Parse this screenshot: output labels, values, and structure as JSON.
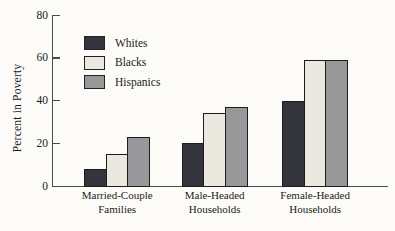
{
  "chart_data": {
    "type": "bar",
    "title": "",
    "ylabel": "Percent in Poverty",
    "xlabel": "",
    "ylim": [
      0,
      80
    ],
    "yticks": [
      0,
      20,
      40,
      60,
      80
    ],
    "grid": false,
    "legend_position": "upper-left-inside",
    "categories": [
      "Married-Couple Families",
      "Male-Headed Households",
      "Female-Headed Households"
    ],
    "category_label_lines": [
      [
        "Married-Couple",
        "Families"
      ],
      [
        "Male-Headed",
        "Households"
      ],
      [
        "Female-Headed",
        "Households"
      ]
    ],
    "series": [
      {
        "name": "Whites",
        "color": "#34343d",
        "values": [
          8,
          20,
          40
        ]
      },
      {
        "name": "Blacks",
        "color": "#eae8df",
        "values": [
          15,
          34,
          59
        ]
      },
      {
        "name": "Hispanics",
        "color": "#98989b",
        "values": [
          23,
          37,
          59
        ]
      }
    ],
    "colors": {
      "bar_border": "#1c1c1c",
      "axis": "#4a4a4a",
      "text": "#1b1b1b",
      "background": "#fcfbf8"
    }
  }
}
